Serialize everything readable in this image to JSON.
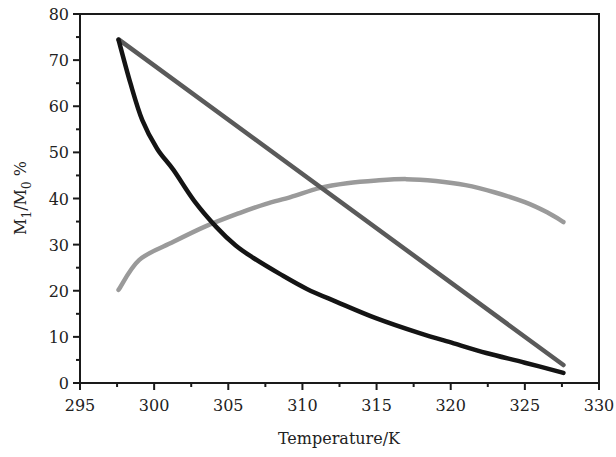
{
  "chart_data": {
    "type": "line",
    "title": "",
    "xlabel": "Temperature/K",
    "ylabel": "M1/M0 %",
    "ylabel_parts": {
      "m": "M",
      "sub1": "1",
      "slash": "/M",
      "sub0": "0",
      "pct": " %"
    },
    "xlim": [
      295,
      330
    ],
    "ylim": [
      0,
      80
    ],
    "x_ticks": [
      295,
      300,
      305,
      310,
      315,
      320,
      325,
      330
    ],
    "y_ticks": [
      0,
      10,
      20,
      30,
      40,
      50,
      60,
      70,
      80
    ],
    "x_minor_step": 2.5,
    "y_minor_step": 5,
    "grid": false,
    "legend": null,
    "series": [
      {
        "name": "dark-gray-linear",
        "color": "#5a5a5a",
        "x": [
          297.6,
          327.6
        ],
        "y": [
          74.5,
          3.9
        ]
      },
      {
        "name": "black-decay",
        "color": "#141414",
        "x": [
          297.6,
          298.4,
          299.2,
          300.2,
          301.3,
          302.7,
          304.2,
          305.5,
          306.7,
          308.5,
          310.3,
          312.3,
          315.0,
          317.9,
          320.2,
          322.4,
          325.0,
          327.6
        ],
        "y": [
          74.4,
          65.0,
          57.0,
          50.8,
          46.2,
          39.5,
          33.8,
          29.8,
          27.1,
          23.6,
          20.4,
          17.6,
          14.0,
          10.8,
          8.6,
          6.5,
          4.4,
          2.2
        ]
      },
      {
        "name": "light-gray-arc",
        "color": "#9a9a9a",
        "x": [
          297.6,
          299.0,
          301.3,
          303.5,
          305.8,
          307.5,
          309.2,
          311.2,
          313.0,
          315.0,
          317.0,
          319.0,
          321.0,
          323.0,
          325.0,
          326.5,
          327.6
        ],
        "y": [
          20.2,
          26.7,
          30.6,
          34.0,
          36.9,
          38.8,
          40.3,
          42.3,
          43.3,
          43.9,
          44.2,
          43.8,
          42.9,
          41.3,
          39.2,
          37.0,
          34.9
        ]
      }
    ]
  }
}
